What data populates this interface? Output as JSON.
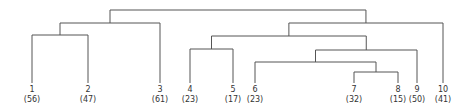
{
  "diagram": {
    "type": "dendrogram",
    "line_color": "#555555",
    "text_color": "#333333",
    "leaves": [
      {
        "id": "1",
        "label": "1",
        "count": "(56)",
        "x": 32
      },
      {
        "id": "2",
        "label": "2",
        "count": "(47)",
        "x": 88
      },
      {
        "id": "3",
        "label": "3",
        "count": "(61)",
        "x": 160
      },
      {
        "id": "4",
        "label": "4",
        "count": "(23)",
        "x": 190
      },
      {
        "id": "5",
        "label": "5",
        "count": "(17)",
        "x": 233
      },
      {
        "id": "6",
        "label": "6",
        "count": "(23)",
        "x": 255
      },
      {
        "id": "7",
        "label": "7",
        "count": "(32)",
        "x": 354
      },
      {
        "id": "8",
        "label": "8",
        "count": "(15)",
        "x": 398
      },
      {
        "id": "9",
        "label": "9",
        "count": "(50)",
        "x": 417
      },
      {
        "id": "10",
        "label": "10",
        "count": "(41)",
        "x": 443
      }
    ],
    "merges": [
      {
        "name": "n12",
        "left": "1",
        "right": "2",
        "y": 35
      },
      {
        "name": "n123",
        "left": "n12",
        "right": "3",
        "y": 23
      },
      {
        "name": "n45",
        "left": "4",
        "right": "5",
        "y": 49
      },
      {
        "name": "n78",
        "left": "7",
        "right": "8",
        "y": 72
      },
      {
        "name": "n678",
        "left": "6",
        "right": "n78",
        "y": 62
      },
      {
        "name": "n6789",
        "left": "n678",
        "right": "9",
        "y": 50
      },
      {
        "name": "n4to9",
        "left": "n45",
        "right": "n6789",
        "y": 36
      },
      {
        "name": "n4to10",
        "left": "n4to9",
        "right": "10",
        "y": 23
      },
      {
        "name": "root",
        "left": "n123",
        "right": "n4to10",
        "y": 10
      }
    ],
    "leaf_top_y": 83
  }
}
